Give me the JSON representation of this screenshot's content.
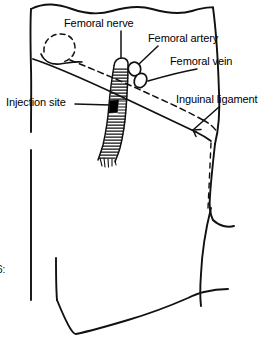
{
  "figure": {
    "type": "anatomical-line-drawing",
    "style": "black ink line art on white background",
    "corner_mark": "6:",
    "labels": {
      "femoral_nerve": "Femoral nerve",
      "femoral_artery": "Femoral artery",
      "femoral_vein": "Femoral vein",
      "injection_site": "Injection site",
      "inguinal_ligament": "Inguinal ligament"
    },
    "colors": {
      "ink": "#111111",
      "background": "#ffffff",
      "injection_marker": "#000000"
    },
    "structures": [
      "torn top edge of skin field",
      "dashed femoral head and bone outline",
      "femoral nerve bundle with transverse hatching",
      "femoral artery oval",
      "femoral vein oval",
      "inguinal ligament band crossing diagonally",
      "black rectangular injection site marker",
      "thigh and groin body contour",
      "torn bottom edge of skin field"
    ]
  }
}
